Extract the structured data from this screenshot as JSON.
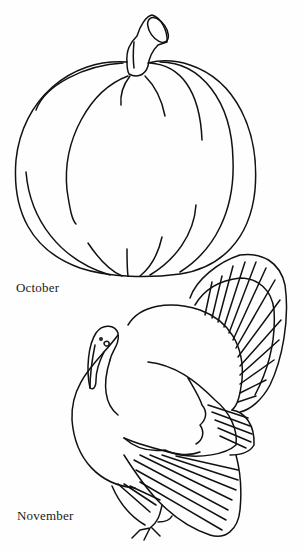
{
  "page": {
    "background": "#fefefe",
    "line_color": "#111111"
  },
  "illustrations": [
    {
      "name": "pumpkin",
      "caption": "October"
    },
    {
      "name": "turkey",
      "caption": "November"
    }
  ],
  "captions": {
    "october": "October",
    "november": "November"
  }
}
